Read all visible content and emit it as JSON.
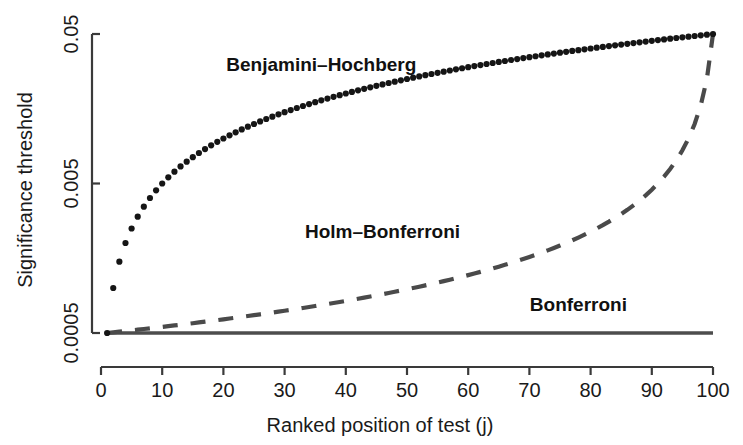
{
  "chart_data": {
    "type": "line",
    "title": "",
    "xlabel": "Ranked position of test (j)",
    "ylabel": "Significance threshold",
    "xlim": [
      0,
      100
    ],
    "ylim": [
      0.0005,
      0.05
    ],
    "yscale": "log",
    "grid": false,
    "legend_position": "inline-annotations",
    "xticks": [
      0,
      10,
      20,
      30,
      40,
      50,
      60,
      70,
      80,
      90,
      100
    ],
    "xtick_labels": [
      "0",
      "10",
      "20",
      "30",
      "40",
      "50",
      "60",
      "70",
      "80",
      "90",
      "100"
    ],
    "yticks": [
      0.0005,
      0.005,
      0.05
    ],
    "ytick_labels": [
      "0.0005",
      "0.005",
      "0.05"
    ],
    "alpha": 0.05,
    "n_tests": 100,
    "series": [
      {
        "name": "Benjamini-Hochberg",
        "label": "Benjamini–Hochberg",
        "style": "dotted-points",
        "color": "#151515",
        "label_x": 36,
        "label_y": 0.0285,
        "formula": "j * 0.05 / 100",
        "x": [
          1,
          2,
          3,
          4,
          5,
          6,
          7,
          8,
          9,
          10,
          11,
          12,
          13,
          14,
          15,
          16,
          17,
          18,
          19,
          20,
          21,
          22,
          23,
          24,
          25,
          26,
          27,
          28,
          29,
          30,
          31,
          32,
          33,
          34,
          35,
          36,
          37,
          38,
          39,
          40,
          41,
          42,
          43,
          44,
          45,
          46,
          47,
          48,
          49,
          50,
          51,
          52,
          53,
          54,
          55,
          56,
          57,
          58,
          59,
          60,
          61,
          62,
          63,
          64,
          65,
          66,
          67,
          68,
          69,
          70,
          71,
          72,
          73,
          74,
          75,
          76,
          77,
          78,
          79,
          80,
          81,
          82,
          83,
          84,
          85,
          86,
          87,
          88,
          89,
          90,
          91,
          92,
          93,
          94,
          95,
          96,
          97,
          98,
          99,
          100
        ],
        "y": [
          0.0005,
          0.001,
          0.0015,
          0.002,
          0.0025,
          0.003,
          0.0035,
          0.004,
          0.0045,
          0.005,
          0.0055,
          0.006,
          0.0065,
          0.007,
          0.0075,
          0.008,
          0.0085,
          0.009,
          0.0095,
          0.01,
          0.0105,
          0.011,
          0.0115,
          0.012,
          0.0125,
          0.013,
          0.0135,
          0.014,
          0.0145,
          0.015,
          0.0155,
          0.016,
          0.0165,
          0.017,
          0.0175,
          0.018,
          0.0185,
          0.019,
          0.0195,
          0.02,
          0.0205,
          0.021,
          0.0215,
          0.022,
          0.0225,
          0.023,
          0.0235,
          0.024,
          0.0245,
          0.025,
          0.0255,
          0.026,
          0.0265,
          0.027,
          0.0275,
          0.028,
          0.0285,
          0.029,
          0.0295,
          0.03,
          0.0305,
          0.031,
          0.0315,
          0.032,
          0.0325,
          0.033,
          0.0335,
          0.034,
          0.0345,
          0.035,
          0.0355,
          0.036,
          0.0365,
          0.037,
          0.0375,
          0.038,
          0.0385,
          0.039,
          0.0395,
          0.04,
          0.0405,
          0.041,
          0.0415,
          0.042,
          0.0425,
          0.043,
          0.0435,
          0.044,
          0.0445,
          0.045,
          0.0455,
          0.046,
          0.0465,
          0.047,
          0.0475,
          0.048,
          0.0485,
          0.049,
          0.0495,
          0.05
        ]
      },
      {
        "name": "Holm-Bonferroni",
        "label": "Holm–Bonferroni",
        "style": "dashed",
        "color": "#4a4a4a",
        "label_x": 46,
        "label_y": 0.00215,
        "formula": "0.05 / (100 - j + 1)",
        "x": [
          1,
          5,
          10,
          15,
          20,
          25,
          30,
          35,
          40,
          45,
          50,
          55,
          60,
          65,
          70,
          75,
          80,
          85,
          90,
          92,
          94,
          95,
          96,
          97,
          98,
          99,
          100
        ],
        "y": [
          0.0005,
          0.000521,
          0.00055,
          0.000581,
          0.000617,
          0.000658,
          0.000704,
          0.000758,
          0.00082,
          0.000893,
          0.00098,
          0.001087,
          0.00122,
          0.001389,
          0.001613,
          0.001923,
          0.002381,
          0.003125,
          0.004545,
          0.005556,
          0.007143,
          0.008333,
          0.01,
          0.0125,
          0.016667,
          0.025,
          0.05
        ]
      },
      {
        "name": "Bonferroni",
        "label": "Bonferroni",
        "style": "solid",
        "color": "#4d4d4d",
        "label_x": 78,
        "label_y": 0.000705,
        "formula": "0.05 / 100",
        "x": [
          1,
          100
        ],
        "y": [
          0.0005,
          0.0005
        ]
      }
    ]
  },
  "axes": {
    "y_axis_title": "Significance threshold",
    "x_axis_title": "Ranked position of test (j)"
  }
}
